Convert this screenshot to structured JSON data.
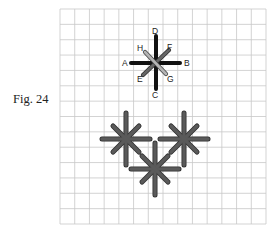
{
  "figure": {
    "caption": "Fig. 24",
    "grid": {
      "columns": 14,
      "rows": 14,
      "x0": 60,
      "y0": 9,
      "x1": 266,
      "y1": 224,
      "line_color": "#c8c8c8"
    },
    "colors": {
      "main_cross": "#111111",
      "diagonal_ef": "#666666",
      "diagonal_hg": "#b4b4b4",
      "stitch_fill": "#5a5a5a",
      "stitch_outline": "#2e2e2e"
    },
    "diagram_star": {
      "center": [
        156,
        63
      ],
      "labels": [
        {
          "id": "A",
          "text": "A",
          "x": 122,
          "y": 66
        },
        {
          "id": "B",
          "text": "B",
          "x": 184,
          "y": 66
        },
        {
          "id": "C",
          "text": "C",
          "x": 152,
          "y": 98
        },
        {
          "id": "D",
          "text": "D",
          "x": 152,
          "y": 34
        },
        {
          "id": "E",
          "text": "E",
          "x": 137,
          "y": 82
        },
        {
          "id": "F",
          "text": "F",
          "x": 167,
          "y": 50
        },
        {
          "id": "G",
          "text": "G",
          "x": 167,
          "y": 82
        },
        {
          "id": "H",
          "text": "H",
          "x": 137,
          "y": 51
        }
      ]
    },
    "stars": [
      {
        "name": "left-star",
        "cx": 126,
        "cy": 139
      },
      {
        "name": "right-star",
        "cx": 184,
        "cy": 139
      },
      {
        "name": "bottom-star",
        "cx": 155,
        "cy": 169
      }
    ]
  }
}
